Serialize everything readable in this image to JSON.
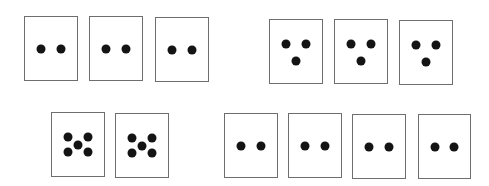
{
  "diagram": {
    "dot_color": "#141414",
    "border_color": "#6e6e6e",
    "groups": [
      {
        "name": "top-left-two-dot-group",
        "count": 3,
        "pattern": "two-horizontal",
        "cards": [
          {
            "x": 24,
            "y": 16,
            "w": 54,
            "h": 65
          },
          {
            "x": 89,
            "y": 16,
            "w": 54,
            "h": 65
          },
          {
            "x": 155,
            "y": 17,
            "w": 54,
            "h": 65
          }
        ]
      },
      {
        "name": "top-right-three-dot-group",
        "count": 3,
        "pattern": "three-triangle",
        "cards": [
          {
            "x": 269,
            "y": 19,
            "w": 54,
            "h": 65
          },
          {
            "x": 334,
            "y": 19,
            "w": 54,
            "h": 65
          },
          {
            "x": 399,
            "y": 20,
            "w": 54,
            "h": 65
          }
        ]
      },
      {
        "name": "bottom-left-five-dot-group",
        "count": 2,
        "pattern": "five-quincunx",
        "cards": [
          {
            "x": 51,
            "y": 112,
            "w": 54,
            "h": 65
          },
          {
            "x": 115,
            "y": 113,
            "w": 54,
            "h": 65
          }
        ]
      },
      {
        "name": "bottom-right-two-dot-group",
        "count": 4,
        "pattern": "two-horizontal",
        "cards": [
          {
            "x": 224,
            "y": 113,
            "w": 54,
            "h": 65
          },
          {
            "x": 288,
            "y": 113,
            "w": 54,
            "h": 65
          },
          {
            "x": 352,
            "y": 114,
            "w": 54,
            "h": 65
          },
          {
            "x": 418,
            "y": 114,
            "w": 53,
            "h": 65
          }
        ]
      }
    ],
    "patterns": {
      "two-horizontal": [
        [
          0.31,
          0.5
        ],
        [
          0.69,
          0.5
        ]
      ],
      "three-triangle": [
        [
          0.31,
          0.38
        ],
        [
          0.69,
          0.38
        ],
        [
          0.5,
          0.65
        ]
      ],
      "five-quincunx": [
        [
          0.31,
          0.38
        ],
        [
          0.69,
          0.38
        ],
        [
          0.5,
          0.5
        ],
        [
          0.31,
          0.62
        ],
        [
          0.69,
          0.62
        ]
      ]
    }
  }
}
